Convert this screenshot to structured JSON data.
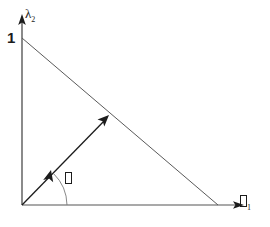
{
  "figure": {
    "background_color": "#ffffff",
    "stroke_color": "#2b2b2b",
    "text_color": "#1c1c1c",
    "width": 270,
    "height": 227,
    "axes": {
      "y_axis_label": "λ",
      "y_axis_label_subscript": "2",
      "x_axis_label_glyph": "tofu-box",
      "x_axis_label_subscript": "1",
      "y_tick_label": "1"
    },
    "angle": {
      "label_glyph": "tofu-box"
    },
    "geometry": {
      "origin_x": 22,
      "origin_y": 205,
      "y_axis_top_y": 20,
      "x_axis_right_x": 245,
      "hypotenuse_start_x": 22,
      "hypotenuse_start_y": 38,
      "hypotenuse_end_x": 218,
      "hypotenuse_end_y": 205,
      "vector_tip_x": 108,
      "vector_tip_y": 117,
      "inner_arrowhead_x": 52,
      "inner_arrowhead_y": 172,
      "arc_start_x": 52,
      "arc_start_y": 172,
      "arc_end_x": 67,
      "arc_end_y": 205
    }
  }
}
